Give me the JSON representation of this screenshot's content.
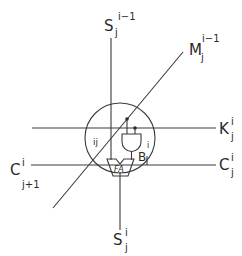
{
  "diagram": {
    "type": "systolic cell schematic",
    "labels": {
      "s_in": {
        "base": "S",
        "sub": "j",
        "sup": "i−1"
      },
      "m_in": {
        "base": "M",
        "sub": "j",
        "sup": "i−1"
      },
      "k": {
        "base": "K",
        "sub": "j",
        "sup": "i"
      },
      "c_in": {
        "base": "C",
        "sub": "j",
        "sup": "i"
      },
      "c_out": {
        "base": "C",
        "sub": "j+1",
        "sup": "i"
      },
      "s_out": {
        "base": "S",
        "sub": "j",
        "sup": "i"
      },
      "b": {
        "base": "B",
        "sub": "j",
        "sup": "i"
      },
      "cell": "ij",
      "fa": "FA"
    },
    "components": [
      "circle-cell",
      "and-gate",
      "full-adder"
    ]
  }
}
